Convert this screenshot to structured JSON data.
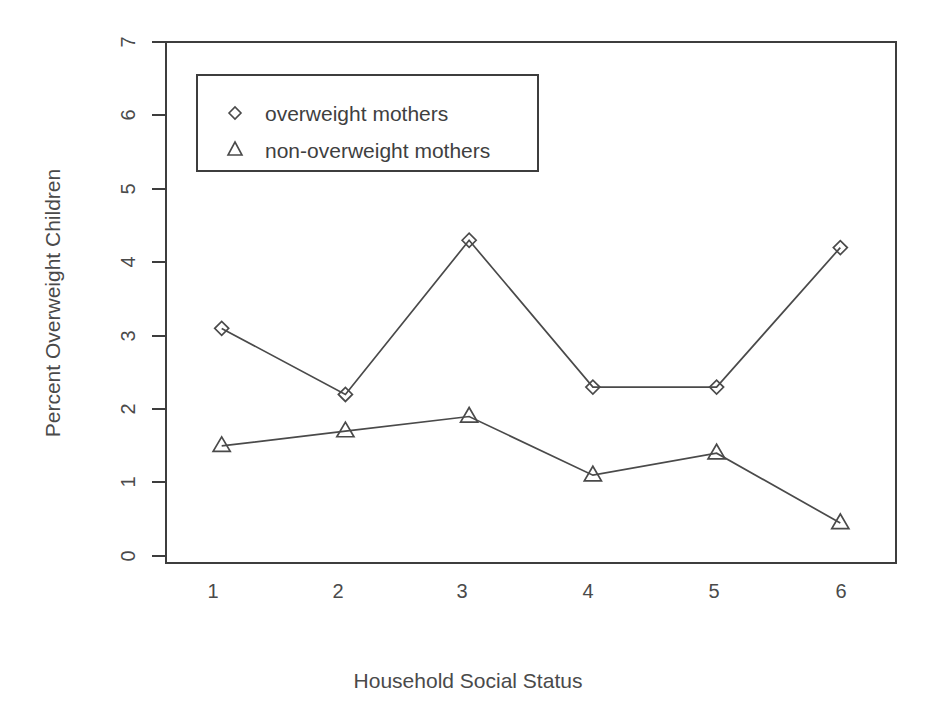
{
  "chart_data": {
    "type": "line",
    "title": "",
    "xlabel": "Household Social Status",
    "ylabel": "Percent Overweight Children",
    "categories": [
      "1",
      "2",
      "3",
      "4",
      "5",
      "6"
    ],
    "x": [
      1,
      2,
      3,
      4,
      5,
      6
    ],
    "xlim": [
      0.55,
      6.45
    ],
    "ylim": [
      0,
      7
    ],
    "yticks": [
      "0",
      "1",
      "2",
      "3",
      "4",
      "5",
      "6",
      "7"
    ],
    "ytick_values": [
      0,
      1,
      2,
      3,
      4,
      5,
      6,
      7
    ],
    "grid": false,
    "legend_position": "top-left",
    "series": [
      {
        "name": "overweight mothers",
        "marker": "diamond",
        "color": "#4a4a4a",
        "values": [
          3.1,
          2.2,
          4.3,
          2.3,
          2.3,
          4.2
        ]
      },
      {
        "name": "non-overweight mothers",
        "marker": "triangle",
        "color": "#4a4a4a",
        "values": [
          1.5,
          1.7,
          1.9,
          1.1,
          1.4,
          0.45
        ]
      }
    ]
  },
  "legend": {
    "entries": [
      {
        "marker": "diamond-marker-icon",
        "label": "overweight mothers"
      },
      {
        "marker": "triangle-marker-icon",
        "label": "non-overweight mothers"
      }
    ]
  },
  "axes": {
    "x_label": "Household Social Status",
    "y_label": "Percent Overweight Children",
    "x_tick_labels": [
      "1",
      "2",
      "3",
      "4",
      "5",
      "6"
    ],
    "y_tick_labels": [
      "0",
      "1",
      "2",
      "3",
      "4",
      "5",
      "6",
      "7"
    ]
  },
  "colors": {
    "line": "#4a4a4a",
    "frame": "#3d3d3d",
    "text": "#4a4a4a",
    "background": "#ffffff"
  }
}
